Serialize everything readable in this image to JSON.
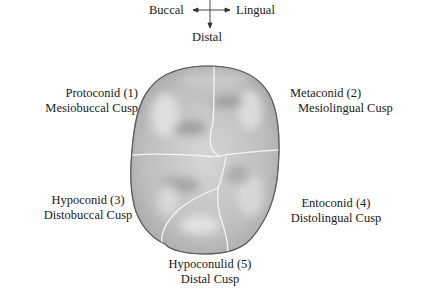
{
  "compass": {
    "left": "Buccal",
    "right": "Lingual",
    "bottom": "Distal",
    "icon": "direction-arrows-icon"
  },
  "cusps": [
    {
      "name": "Protoconid (1)",
      "description": "Mesiobuccal Cusp"
    },
    {
      "name": "Metaconid (2)",
      "description": "Mesiolingual Cusp"
    },
    {
      "name": "Hypoconid (3)",
      "description": "Distobuccal Cusp"
    },
    {
      "name": "Entoconid (4)",
      "description": "Distolingual Cusp"
    },
    {
      "name": "Hypoconulid (5)",
      "description": "Distal Cusp"
    }
  ],
  "figure": {
    "colors": {
      "outline": "#6e6e6e",
      "fill": "#b9b9b9",
      "fill_light": "#dcdcdc",
      "groove": "#f2f2f2",
      "text": "#1a1a1a"
    }
  }
}
